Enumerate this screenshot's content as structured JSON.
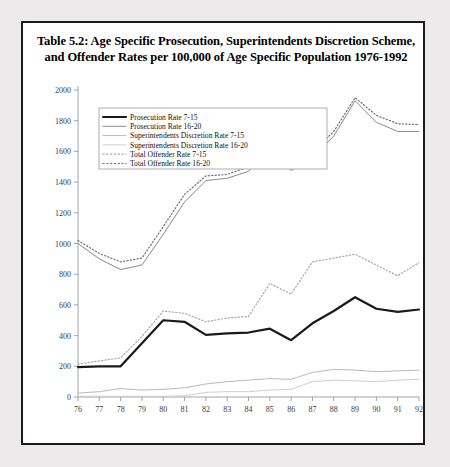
{
  "figure": {
    "title_line1": "Table 5.2: Age Specific Prosecution, Superintendents Discretion Scheme,",
    "title_line2": "and Offender Rates per 100,000 of Age Specific Population 1976-1992",
    "background": "#eceaea",
    "panel_background": "#ffffff",
    "border_color": "#1a1a1a"
  },
  "chart_data": {
    "type": "line",
    "title": "Table 5.2: Age Specific Prosecution, Superintendents Discretion Scheme, and Offender Rates per 100,000 of Age Specific Population 1976-1992",
    "xlabel": "",
    "ylabel": "",
    "grid": false,
    "legend_position": "top-left-inside",
    "xlim": [
      76,
      92
    ],
    "ylim": [
      0,
      2000
    ],
    "yticks": [
      0,
      200,
      400,
      600,
      800,
      1000,
      1200,
      1400,
      1600,
      1800,
      2000
    ],
    "ytick_labels": [
      "0",
      "200",
      "400",
      "600",
      "800",
      "1000",
      "1200",
      "1400",
      "1600",
      "1800",
      "2000"
    ],
    "categories": [
      76,
      77,
      78,
      79,
      80,
      81,
      82,
      83,
      84,
      85,
      86,
      87,
      88,
      89,
      90,
      91,
      92
    ],
    "xtick_labels": [
      "76",
      "77",
      "78",
      "79",
      "80",
      "81",
      "82",
      "83",
      "84",
      "85",
      "86",
      "87",
      "88",
      "89",
      "90",
      "91",
      "92"
    ],
    "series": [
      {
        "name": "Prosecution Rate 7-15",
        "style": "solid",
        "width": 2.2,
        "color": "#1a1a1a",
        "values": [
          195,
          200,
          200,
          350,
          500,
          490,
          405,
          415,
          420,
          445,
          370,
          480,
          560,
          650,
          575,
          555,
          570
        ]
      },
      {
        "name": "Prosecution Rate 16-20",
        "style": "solid",
        "width": 1.0,
        "color": "#8a8a8a",
        "values": [
          1000,
          900,
          830,
          860,
          1060,
          1270,
          1410,
          1425,
          1470,
          1620,
          1475,
          1560,
          1700,
          1930,
          1790,
          1730,
          1730
        ]
      },
      {
        "name": "Superintendents Discretion Rate 7-15",
        "style": "solid",
        "width": 1.0,
        "color": "#b9b9b9",
        "values": [
          25,
          35,
          55,
          45,
          50,
          60,
          85,
          100,
          110,
          120,
          115,
          160,
          180,
          175,
          165,
          170,
          175
        ]
      },
      {
        "name": "Superintendents Discretion Rate 16-20",
        "style": "solid",
        "width": 1.0,
        "color": "#cfcfcf",
        "values": [
          5,
          5,
          5,
          5,
          5,
          8,
          30,
          35,
          35,
          45,
          50,
          100,
          110,
          105,
          100,
          110,
          115
        ]
      },
      {
        "name": "Total Offender Rate 7-15",
        "style": "dotted",
        "width": 1.2,
        "color": "#a6a6a6",
        "values": [
          215,
          235,
          255,
          395,
          560,
          545,
          490,
          515,
          525,
          740,
          670,
          880,
          905,
          930,
          860,
          790,
          875
        ]
      },
      {
        "name": "Total Offender Rate 16-20",
        "style": "dotted",
        "width": 1.2,
        "color": "#6e6e6e",
        "values": [
          1020,
          935,
          880,
          905,
          1110,
          1320,
          1440,
          1450,
          1500,
          1625,
          1490,
          1595,
          1730,
          1950,
          1835,
          1780,
          1775
        ]
      }
    ]
  },
  "legend": {
    "items": [
      {
        "label": "Prosecution Rate 7-15"
      },
      {
        "label": "Prosecution Rate 16-20"
      },
      {
        "label": "Superintendents Discretion Rate 7-15"
      },
      {
        "label": "Superintendents Discretion Rate 16-20"
      },
      {
        "label": "Total Offender Rate 7-15"
      },
      {
        "label": "Total Offender Rate 16-20"
      }
    ]
  }
}
